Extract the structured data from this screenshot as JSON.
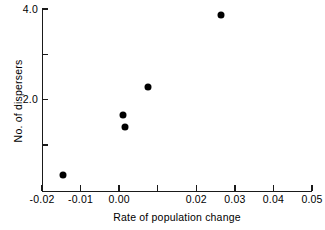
{
  "chart_data": {
    "type": "scatter",
    "title": "",
    "xlabel": "Rate of population change",
    "ylabel": "No. of dispersers",
    "xlim": [
      -0.02,
      0.05
    ],
    "ylim": [
      0.0,
      4.0
    ],
    "grid": false,
    "legend": null,
    "xticks": [
      {
        "value": -0.02,
        "label": "-0.02"
      },
      {
        "value": -0.01,
        "label": "-0.01"
      },
      {
        "value": 0.0,
        "label": "0.00"
      },
      {
        "value": 0.01,
        "label": ""
      },
      {
        "value": 0.02,
        "label": "0.02"
      },
      {
        "value": 0.03,
        "label": "0.03"
      },
      {
        "value": 0.04,
        "label": "0.04"
      },
      {
        "value": 0.05,
        "label": "0.05"
      }
    ],
    "yticks": [
      {
        "value": 4.0,
        "label": "4.0"
      },
      {
        "value": 3.0,
        "label": ""
      },
      {
        "value": 2.0,
        "label": "2.0"
      },
      {
        "value": 1.0,
        "label": ""
      }
    ],
    "points": [
      {
        "x": -0.0145,
        "y": 0.34
      },
      {
        "x": 0.001,
        "y": 1.66
      },
      {
        "x": 0.0015,
        "y": 1.41
      },
      {
        "x": 0.0076,
        "y": 2.27
      },
      {
        "x": 0.0263,
        "y": 3.86
      }
    ],
    "marker": {
      "shape": "circle",
      "color": "#000000",
      "size": 7
    }
  }
}
